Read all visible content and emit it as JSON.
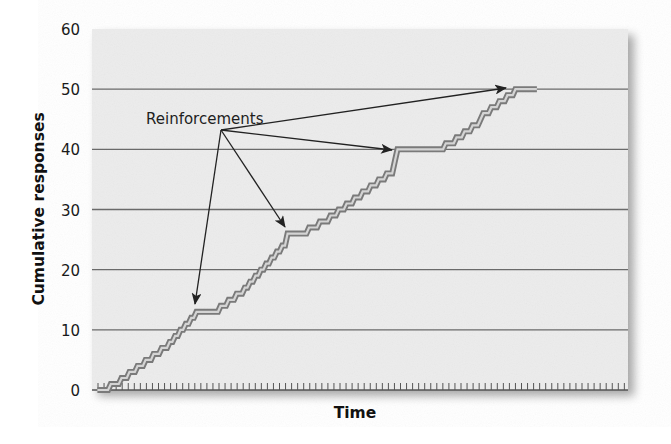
{
  "chart_data": {
    "type": "line",
    "title": "",
    "xlabel": "Time",
    "ylabel": "Cumulative responses",
    "ylim": [
      0,
      60
    ],
    "xlim": [
      0,
      100
    ],
    "yticks": [
      0,
      10,
      20,
      30,
      40,
      50,
      60
    ],
    "grid": {
      "horizontal": true,
      "vertical": false
    },
    "x_axis_minor_ticks": true,
    "legend": null,
    "series": [
      {
        "name": "Cumulative record",
        "style": "staircase, double gray stroke",
        "points": [
          [
            1,
            0
          ],
          [
            3,
            0
          ],
          [
            3.5,
            1
          ],
          [
            5,
            1
          ],
          [
            5.5,
            2
          ],
          [
            6.5,
            2
          ],
          [
            7,
            3
          ],
          [
            8,
            3
          ],
          [
            8.5,
            4
          ],
          [
            9.5,
            4
          ],
          [
            10,
            5
          ],
          [
            11,
            5
          ],
          [
            11.5,
            6
          ],
          [
            12.5,
            6
          ],
          [
            13,
            7
          ],
          [
            14,
            7
          ],
          [
            14.5,
            8
          ],
          [
            15,
            8
          ],
          [
            15.5,
            9
          ],
          [
            16,
            9
          ],
          [
            16.5,
            10
          ],
          [
            17,
            10
          ],
          [
            17.5,
            11
          ],
          [
            18,
            11
          ],
          [
            18.5,
            12
          ],
          [
            19,
            12
          ],
          [
            19.5,
            13
          ],
          [
            23.5,
            13
          ],
          [
            24,
            14
          ],
          [
            25,
            14
          ],
          [
            25.5,
            15
          ],
          [
            26.5,
            15
          ],
          [
            27,
            16
          ],
          [
            28,
            16
          ],
          [
            28.5,
            17
          ],
          [
            29,
            17
          ],
          [
            29.5,
            18
          ],
          [
            30,
            18
          ],
          [
            30.5,
            19
          ],
          [
            31,
            19
          ],
          [
            31.5,
            20
          ],
          [
            32,
            20
          ],
          [
            32.5,
            21
          ],
          [
            33,
            21
          ],
          [
            33.5,
            22
          ],
          [
            34,
            22
          ],
          [
            34.5,
            23
          ],
          [
            35,
            23
          ],
          [
            35.5,
            24
          ],
          [
            36,
            24
          ],
          [
            36.5,
            26
          ],
          [
            40,
            26
          ],
          [
            40.5,
            27
          ],
          [
            42,
            27
          ],
          [
            42.5,
            28
          ],
          [
            44,
            28
          ],
          [
            44.5,
            29
          ],
          [
            45.5,
            29
          ],
          [
            46,
            30
          ],
          [
            47,
            30
          ],
          [
            47.5,
            31
          ],
          [
            48.5,
            31
          ],
          [
            49,
            32
          ],
          [
            50,
            32
          ],
          [
            50.5,
            33
          ],
          [
            51.5,
            33
          ],
          [
            52,
            34
          ],
          [
            53,
            34
          ],
          [
            53.5,
            35
          ],
          [
            54.5,
            35
          ],
          [
            55,
            36
          ],
          [
            56,
            36
          ],
          [
            56.5,
            38
          ],
          [
            57,
            40
          ],
          [
            65.5,
            40
          ],
          [
            66,
            41
          ],
          [
            67.5,
            41
          ],
          [
            68,
            42
          ],
          [
            69,
            42
          ],
          [
            69.5,
            43
          ],
          [
            70.5,
            43
          ],
          [
            71,
            44
          ],
          [
            72,
            44
          ],
          [
            72.5,
            45
          ],
          [
            73,
            46
          ],
          [
            74,
            46
          ],
          [
            74.5,
            47
          ],
          [
            75.5,
            47
          ],
          [
            76,
            48
          ],
          [
            77,
            48
          ],
          [
            77.5,
            49
          ],
          [
            78.5,
            49
          ],
          [
            79,
            50
          ],
          [
            83,
            50
          ]
        ]
      }
    ],
    "reinforcements": [
      {
        "t": 19.5,
        "value": 13
      },
      {
        "t": 36.5,
        "value": 26
      },
      {
        "t": 57,
        "value": 40
      },
      {
        "t": 79,
        "value": 50
      }
    ],
    "annotations": [
      {
        "text": "Reinforcements",
        "position": [
          10,
          46
        ],
        "arrows_to": "reinforcements"
      }
    ]
  },
  "colors": {
    "plot_background": "#ececec",
    "gridline": "#6a6a6a",
    "line_outer": "#7a7a7a",
    "line_inner": "#d4d4d4",
    "arrow": "#222222",
    "text": "#1a1a1a"
  }
}
